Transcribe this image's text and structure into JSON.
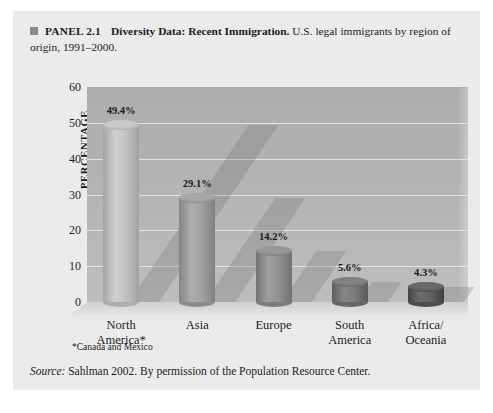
{
  "panel": {
    "bullet_icon": "square-bullet-icon",
    "number": "PANEL 2.1",
    "subject": "Diversity Data: Recent Immigration.",
    "description": "U.S. legal immigrants by region of origin, 1991–2000."
  },
  "footnote": "*Canada and Mexico",
  "source": {
    "label": "Source:",
    "text": " Sahlman 2002. By permission of the Population Resource Center."
  },
  "axis": {
    "y_label": "PERCENTAGE",
    "ticks": [
      "60",
      "50",
      "40",
      "30",
      "20",
      "10",
      "0"
    ]
  },
  "colors": {
    "panel_background": "#ebebeb",
    "plot_wall": "#b4b4b4",
    "gridline": "#e3e3e3",
    "floor": "#dcdcdc",
    "text": "#1c1c1c",
    "bullet": "#8a8a8a"
  },
  "chart_data": {
    "type": "bar",
    "title": "Diversity Data: Recent Immigration",
    "subtitle": "U.S. legal immigrants by region of origin, 1991–2000",
    "categories": [
      "North America*",
      "Asia",
      "Europe",
      "South America",
      "Africa/ Oceania"
    ],
    "category_lines": [
      [
        "North",
        "America*"
      ],
      [
        "Asia",
        ""
      ],
      [
        "Europe",
        ""
      ],
      [
        "South",
        "America"
      ],
      [
        "Africa/",
        "Oceania"
      ]
    ],
    "values": [
      49.4,
      29.1,
      14.2,
      5.6,
      4.3
    ],
    "value_labels": [
      "49.4%",
      "29.1%",
      "14.2%",
      "5.6%",
      "4.3%"
    ],
    "bar_colors": [
      "#bfbfbf",
      "#9e9e9e",
      "#8e8e8e",
      "#787878",
      "#5e5e5e"
    ],
    "xlabel": "",
    "ylabel": "PERCENTAGE",
    "ylim": [
      0,
      60
    ],
    "ytick_values": [
      60,
      50,
      40,
      30,
      20,
      10,
      0
    ],
    "grid": true,
    "legend": "none",
    "style": "3d-cylinder"
  }
}
